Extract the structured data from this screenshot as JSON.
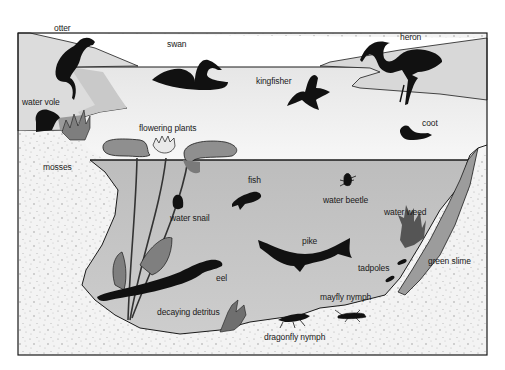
{
  "colors": {
    "background": "#ffffff",
    "sky_water_surface": "#efefef",
    "bank_light": "#dcdcdc",
    "underwater": "#c4c4c4",
    "soil": "#f2f2f2",
    "soil_speckle": "#9a9a9a",
    "plant_leaf": "#8a8a8a",
    "green_slime": "#9c9c9c",
    "silhouette": "#111111",
    "outline": "#1a1a1a"
  },
  "labels": {
    "otter": "otter",
    "swan": "swan",
    "heron": "heron",
    "kingfisher": "kingfisher",
    "water_vole": "water vole",
    "coot": "coot",
    "flowering_plants": "flowering plants",
    "mosses": "mosses",
    "fish": "fish",
    "water_beetle": "water beetle",
    "water_snail": "water snail",
    "water_weed": "water weed",
    "pike": "pike",
    "tadpoles": "tadpoles",
    "green_slime": "green slime",
    "eel": "eel",
    "mayfly_nymph": "mayfly nymph",
    "decaying_detritus": "decaying detritus",
    "dragonfly_nymph": "dragonfly nymph"
  }
}
